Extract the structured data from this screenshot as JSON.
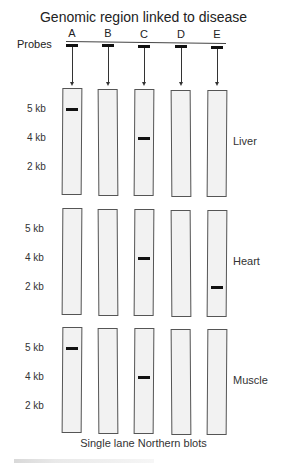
{
  "title": "Genomic region linked to disease",
  "probes_label": "Probes",
  "probes": [
    "A",
    "B",
    "C",
    "D",
    "E"
  ],
  "size_markers": [
    "5 kb",
    "4 kb",
    "2 kb"
  ],
  "panels": [
    {
      "tissue": "Liver",
      "bands": [
        {
          "probe": "A",
          "size": "5 kb"
        },
        {
          "probe": "C",
          "size": "4 kb"
        }
      ]
    },
    {
      "tissue": "Heart",
      "bands": [
        {
          "probe": "C",
          "size": "4 kb"
        },
        {
          "probe": "E",
          "size": "2 kb"
        }
      ]
    },
    {
      "tissue": "Muscle",
      "bands": [
        {
          "probe": "A",
          "size": "5 kb"
        },
        {
          "probe": "C",
          "size": "4 kb"
        }
      ]
    }
  ],
  "caption": "Single lane Northern blots",
  "colors": {
    "lane_fill": "#f2f2f2",
    "lane_border": "#555555",
    "band": "#111111"
  }
}
